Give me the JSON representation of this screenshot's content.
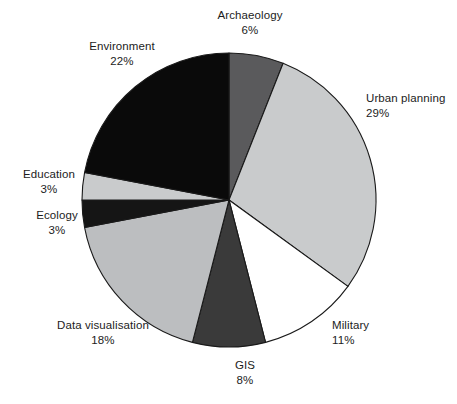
{
  "chart_data": {
    "type": "pie",
    "title": "",
    "subtitle": "",
    "xlabel": "",
    "ylabel": "",
    "legend_position": "none",
    "grid": false,
    "label_format": "name + percent",
    "start_angle_deg": 0,
    "direction": "clockwise",
    "total_percent": 100,
    "categories": [
      "Archaeology",
      "Urban planning",
      "Military",
      "GIS",
      "Data visualisation",
      "Ecology",
      "Education",
      "Environment"
    ],
    "values": [
      6,
      29,
      11,
      8,
      18,
      3,
      3,
      22
    ],
    "value_labels": [
      "6%",
      "29%",
      "11%",
      "8%",
      "18%",
      "3%",
      "3%",
      "22%"
    ],
    "colors": [
      "#5a5a5c",
      "#c9cbcc",
      "#ffffff",
      "#3a3a3a",
      "#bcbec0",
      "#151515",
      "#c9cbcc",
      "#0a0a0a"
    ],
    "slices": [
      {
        "name": "Archaeology",
        "value": 6,
        "value_label": "6%",
        "color": "#5a5a5c"
      },
      {
        "name": "Urban planning",
        "value": 29,
        "value_label": "29%",
        "color": "#c9cbcc"
      },
      {
        "name": "Military",
        "value": 11,
        "value_label": "11%",
        "color": "#ffffff"
      },
      {
        "name": "GIS",
        "value": 8,
        "value_label": "8%",
        "color": "#3a3a3a"
      },
      {
        "name": "Data visualisation",
        "value": 18,
        "value_label": "18%",
        "color": "#bcbec0"
      },
      {
        "name": "Ecology",
        "value": 3,
        "value_label": "3%",
        "color": "#151515"
      },
      {
        "name": "Education",
        "value": 3,
        "value_label": "3%",
        "color": "#c9cbcc"
      },
      {
        "name": "Environment",
        "value": 22,
        "value_label": "22%",
        "color": "#0a0a0a"
      }
    ]
  },
  "labels": [
    {
      "name": "Archaeology",
      "value_label": "6%",
      "x": 250,
      "y": 8,
      "align": "center"
    },
    {
      "name": "Urban planning",
      "value_label": "29%",
      "x": 366,
      "y": 91,
      "align": "left"
    },
    {
      "name": "Military",
      "value_label": "11%",
      "x": 332,
      "y": 318,
      "align": "left"
    },
    {
      "name": "GIS",
      "value_label": "8%",
      "x": 245,
      "y": 358,
      "align": "center"
    },
    {
      "name": "Data visualisation",
      "value_label": "18%",
      "x": 103,
      "y": 318,
      "align": "center"
    },
    {
      "name": "Ecology",
      "value_label": "3%",
      "x": 57,
      "y": 208,
      "align": "center"
    },
    {
      "name": "Education",
      "value_label": "3%",
      "x": 49,
      "y": 167,
      "align": "center"
    },
    {
      "name": "Environment",
      "value_label": "22%",
      "x": 122,
      "y": 39,
      "align": "center"
    }
  ],
  "geometry": {
    "cx": 229,
    "cy": 200,
    "r": 147,
    "stroke": "#1a1a1a"
  }
}
